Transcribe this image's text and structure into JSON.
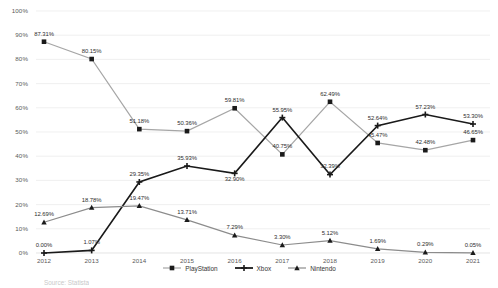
{
  "chart_data": {
    "type": "line",
    "title": "",
    "xlabel": "",
    "ylabel": "",
    "ylim": [
      0,
      100
    ],
    "grid": true,
    "legend_position": "bottom",
    "categories": [
      "2012",
      "2013",
      "2014",
      "2015",
      "2016",
      "2017",
      "2018",
      "2019",
      "2020",
      "2021"
    ],
    "ytick_labels": [
      "0%",
      "10%",
      "20%",
      "30%",
      "40%",
      "50%",
      "60%",
      "70%",
      "80%",
      "90%",
      "100%"
    ],
    "ytick_values": [
      0,
      10,
      20,
      30,
      40,
      50,
      60,
      70,
      80,
      90,
      100
    ],
    "series": [
      {
        "name": "PlayStation",
        "marker": "square",
        "line_color": "#a6a6a6",
        "marker_color": "#1a1a1a",
        "values": [
          87.31,
          80.15,
          51.18,
          50.36,
          59.81,
          40.75,
          62.49,
          45.47,
          42.48,
          46.65
        ],
        "labels": [
          "87.31%",
          "80.15%",
          "51.18%",
          "50.36%",
          "59.81%",
          "40.75%",
          "62.49%",
          "45.47%",
          "42.48%",
          "46.65%"
        ]
      },
      {
        "name": "Xbox",
        "marker": "cross",
        "line_color": "#1a1a1a",
        "marker_color": "#1a1a1a",
        "values": [
          0.0,
          1.07,
          29.35,
          35.93,
          32.9,
          55.95,
          32.39,
          52.64,
          57.23,
          53.3
        ],
        "labels": [
          "0.00%",
          "1.07%",
          "29.35%",
          "35.93%",
          "32.90%",
          "55.95%",
          "32.39%",
          "52.64%",
          "57.23%",
          "53.30%"
        ]
      },
      {
        "name": "Nintendo",
        "marker": "triangle",
        "line_color": "#8c8c8c",
        "marker_color": "#1a1a1a",
        "values": [
          12.69,
          18.78,
          19.47,
          13.71,
          7.29,
          3.3,
          5.12,
          1.69,
          0.29,
          0.05
        ],
        "labels": [
          "12.69%",
          "18.78%",
          "19.47%",
          "13.71%",
          "7.29%",
          "3.30%",
          "5.12%",
          "1.69%",
          "0.29%",
          "0.05%"
        ]
      }
    ]
  },
  "legend": {
    "items": [
      {
        "label": "PlayStation"
      },
      {
        "label": "Xbox"
      },
      {
        "label": "Nintendo"
      }
    ]
  },
  "footer": {
    "source": "Source: Statista"
  }
}
